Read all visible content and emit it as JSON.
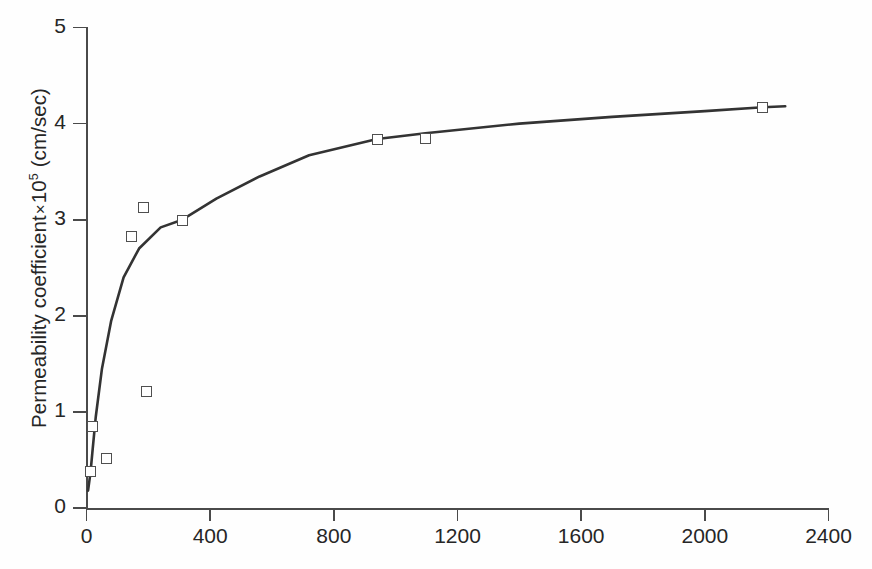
{
  "chart_data": {
    "type": "scatter",
    "title": "",
    "xlabel": "",
    "ylabel": "Permeability coefficient × 10⁵ (cm/sec)",
    "ylabel_parts": {
      "prefix": "Permeability coefficient",
      "times": "×",
      "base": "10",
      "exponent": "5",
      "units": "(cm/sec)"
    },
    "xlim": [
      0,
      2400
    ],
    "ylim": [
      0,
      5
    ],
    "xticks": [
      "0",
      "400",
      "800",
      "1200",
      "1600",
      "2000",
      "2400"
    ],
    "xtick_values": [
      0,
      400,
      800,
      1200,
      1600,
      2000,
      2400
    ],
    "yticks": [
      "0",
      "1",
      "2",
      "3",
      "4",
      "5"
    ],
    "ytick_values": [
      0,
      1,
      2,
      3,
      4,
      5
    ],
    "grid": false,
    "legend": "none",
    "marker_style": "open-square",
    "line_style": "solid-fitted-curve",
    "colors": {
      "curve": "#333333",
      "marker_edge": "#4f4f4f",
      "marker_fill": "#ffffff",
      "axis": "#4a4a4a",
      "text": "#262626",
      "background": "#fefefe"
    },
    "series": [
      {
        "name": "Permeability data",
        "points": [
          {
            "x": 13,
            "y": 0.38
          },
          {
            "x": 19,
            "y": 0.85
          },
          {
            "x": 64,
            "y": 0.52
          },
          {
            "x": 144,
            "y": 2.82
          },
          {
            "x": 185,
            "y": 3.13
          },
          {
            "x": 195,
            "y": 1.21
          },
          {
            "x": 310,
            "y": 2.99
          },
          {
            "x": 940,
            "y": 3.83
          },
          {
            "x": 1096,
            "y": 3.84
          },
          {
            "x": 2188,
            "y": 4.17
          }
        ]
      },
      {
        "name": "Fitted curve",
        "type": "line",
        "points": [
          {
            "x": 5,
            "y": 0.18
          },
          {
            "x": 13,
            "y": 0.37
          },
          {
            "x": 19,
            "y": 0.58
          },
          {
            "x": 30,
            "y": 0.95
          },
          {
            "x": 50,
            "y": 1.45
          },
          {
            "x": 80,
            "y": 1.95
          },
          {
            "x": 120,
            "y": 2.4
          },
          {
            "x": 170,
            "y": 2.7
          },
          {
            "x": 240,
            "y": 2.92
          },
          {
            "x": 310,
            "y": 3.0
          },
          {
            "x": 420,
            "y": 3.22
          },
          {
            "x": 560,
            "y": 3.45
          },
          {
            "x": 720,
            "y": 3.67
          },
          {
            "x": 940,
            "y": 3.84
          },
          {
            "x": 1096,
            "y": 3.9
          },
          {
            "x": 1400,
            "y": 4.0
          },
          {
            "x": 1700,
            "y": 4.07
          },
          {
            "x": 2000,
            "y": 4.13
          },
          {
            "x": 2188,
            "y": 4.17
          },
          {
            "x": 2260,
            "y": 4.18
          }
        ]
      }
    ]
  }
}
